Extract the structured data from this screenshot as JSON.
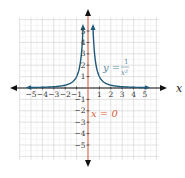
{
  "chart_data": {
    "type": "line",
    "title": "",
    "xlabel": "x",
    "ylabel": "",
    "xlim": [
      -6,
      6
    ],
    "ylim": [
      -6,
      6
    ],
    "grid": true,
    "x_ticks": [
      "-5",
      "-4",
      "-3",
      "-2",
      "-1",
      "1",
      "2",
      "3",
      "4",
      "5"
    ],
    "y_ticks": [
      "5",
      "4",
      "3",
      "2",
      "1",
      "-1",
      "-2",
      "-3",
      "-4",
      "-5"
    ],
    "series": [
      {
        "name": "y = 1/x²",
        "function": "1/x^2",
        "color": "#1f5a7a",
        "branches": [
          {
            "x": [
              -5,
              -4,
              -3,
              -2,
              -1.5,
              -1,
              -0.75,
              -0.6,
              -0.5,
              -0.45
            ],
            "y": [
              0.04,
              0.0625,
              0.111,
              0.25,
              0.444,
              1,
              1.778,
              2.778,
              4,
              4.94
            ]
          },
          {
            "x": [
              0.45,
              0.5,
              0.6,
              0.75,
              1,
              1.5,
              2,
              3,
              4,
              5
            ],
            "y": [
              4.94,
              4,
              2.778,
              1.778,
              1,
              0.444,
              0.25,
              0.111,
              0.0625,
              0.04
            ]
          }
        ]
      },
      {
        "name": "x = 0",
        "type": "vertical_asymptote",
        "x": 0,
        "color": "#d9623b"
      }
    ],
    "annotations": [
      {
        "text": "y = 1/x²",
        "x": 1.4,
        "y": 2.1,
        "color": "#5a8aa0"
      },
      {
        "text": "x = 0",
        "x": 0.25,
        "y": -2.3,
        "color": "#d9623b"
      }
    ]
  },
  "labels": {
    "x_axis_name": "x",
    "curve_label_lhs": "y =",
    "curve_label_num": "1",
    "curve_label_den": "x²",
    "asymptote_label": "x = 0",
    "x_ticks": [
      "−5",
      "−4",
      "−3",
      "−2",
      "−1",
      "1",
      "2",
      "3",
      "4",
      "5"
    ],
    "y_ticks_pos": [
      "5",
      "4",
      "3",
      "2",
      "1"
    ],
    "y_ticks_neg": [
      "−1",
      "−2",
      "−3",
      "−4",
      "−5"
    ]
  },
  "colors": {
    "curve": "#1f5a7a",
    "asymptote": "#d9623b",
    "grid": "#dcdcdc",
    "axis": "#111111",
    "curve_label": "#5a8aa0"
  }
}
